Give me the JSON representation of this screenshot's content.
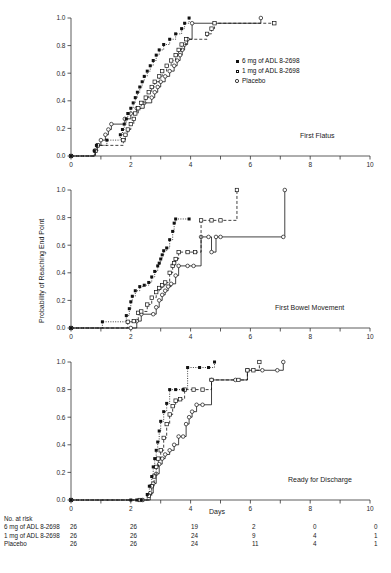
{
  "figure": {
    "y_axis_label": "Probability of Reaching End Point",
    "x_axis_label": "Days",
    "risk_title": "No. at risk"
  },
  "legend": {
    "items": [
      {
        "label": "6 mg of ADL 8-2698",
        "marker": "filled-square-icon"
      },
      {
        "label": "1 mg of ADL 8-2698",
        "marker": "open-square-icon"
      },
      {
        "label": "Placebo",
        "marker": "open-circle-icon"
      }
    ]
  },
  "risk_table": {
    "columns": [
      "0",
      "2",
      "4",
      "6",
      "8",
      "10"
    ],
    "rows": [
      {
        "name": "6 mg of ADL 8-2698",
        "values": [
          "26",
          "26",
          "19",
          "2",
          "0",
          "0"
        ]
      },
      {
        "name": "1 mg of ADL 8-2698",
        "values": [
          "26",
          "26",
          "24",
          "9",
          "4",
          "1"
        ]
      },
      {
        "name": "Placebo",
        "values": [
          "26",
          "26",
          "24",
          "11",
          "4",
          "1"
        ]
      }
    ]
  },
  "chart_data": [
    {
      "type": "line",
      "title": "First Flatus",
      "panel_index": 0,
      "xlabel": "",
      "ylabel": "",
      "xlim": [
        0,
        10
      ],
      "ylim": [
        0,
        1.0
      ],
      "xticks": [
        0,
        1,
        2,
        3,
        4,
        5,
        6,
        7,
        8,
        9,
        10
      ],
      "xticklabels": [
        "0",
        "",
        "2",
        "",
        "4",
        "",
        "6",
        "",
        "8",
        "",
        "10"
      ],
      "yticks": [
        0.0,
        0.2,
        0.4,
        0.6,
        0.8,
        1.0
      ],
      "yticklabels": [
        "0.0",
        "0.2",
        "0.4",
        "0.6",
        "0.8",
        "1.0"
      ],
      "grid": false,
      "legend_position": "right-middle",
      "series": [
        {
          "name": "6 mg of ADL 8-2698",
          "marker": "filled-square",
          "linestyle": "dotted",
          "points": [
            [
              0,
              0.0
            ],
            [
              0.78,
              0.038
            ],
            [
              0.85,
              0.077
            ],
            [
              1.2,
              0.115
            ],
            [
              1.65,
              0.154
            ],
            [
              1.72,
              0.192
            ],
            [
              1.78,
              0.231
            ],
            [
              1.85,
              0.269
            ],
            [
              1.9,
              0.308
            ],
            [
              2.0,
              0.346
            ],
            [
              2.08,
              0.385
            ],
            [
              2.15,
              0.423
            ],
            [
              2.22,
              0.462
            ],
            [
              2.3,
              0.5
            ],
            [
              2.38,
              0.538
            ],
            [
              2.45,
              0.577
            ],
            [
              2.55,
              0.615
            ],
            [
              2.65,
              0.654
            ],
            [
              2.75,
              0.692
            ],
            [
              2.85,
              0.731
            ],
            [
              2.95,
              0.769
            ],
            [
              3.1,
              0.808
            ],
            [
              3.3,
              0.846
            ],
            [
              3.5,
              0.885
            ],
            [
              3.7,
              0.923
            ],
            [
              3.8,
              0.962
            ],
            [
              3.95,
              1.0
            ]
          ]
        },
        {
          "name": "1 mg of ADL 8-2698",
          "marker": "open-square",
          "linestyle": "dashed",
          "points": [
            [
              0,
              0.0
            ],
            [
              0.82,
              0.038
            ],
            [
              0.9,
              0.077
            ],
            [
              1.75,
              0.115
            ],
            [
              1.82,
              0.154
            ],
            [
              1.9,
              0.192
            ],
            [
              2.0,
              0.231
            ],
            [
              2.1,
              0.269
            ],
            [
              2.15,
              0.308
            ],
            [
              2.25,
              0.346
            ],
            [
              2.35,
              0.385
            ],
            [
              2.5,
              0.423
            ],
            [
              2.6,
              0.462
            ],
            [
              2.7,
              0.5
            ],
            [
              2.8,
              0.538
            ],
            [
              2.95,
              0.577
            ],
            [
              3.05,
              0.615
            ],
            [
              3.2,
              0.654
            ],
            [
              3.35,
              0.692
            ],
            [
              3.5,
              0.731
            ],
            [
              3.6,
              0.769
            ],
            [
              3.7,
              0.808
            ],
            [
              3.85,
              0.846
            ],
            [
              4.55,
              0.885
            ],
            [
              4.7,
              0.923
            ],
            [
              4.8,
              0.962
            ],
            [
              6.8,
              0.962
            ]
          ]
        },
        {
          "name": "Placebo",
          "marker": "open-circle",
          "linestyle": "solid",
          "points": [
            [
              0,
              0.0
            ],
            [
              0.8,
              0.038
            ],
            [
              0.88,
              0.077
            ],
            [
              1.0,
              0.115
            ],
            [
              1.15,
              0.154
            ],
            [
              1.25,
              0.192
            ],
            [
              1.35,
              0.231
            ],
            [
              1.8,
              0.269
            ],
            [
              2.0,
              0.308
            ],
            [
              2.2,
              0.346
            ],
            [
              2.45,
              0.385
            ],
            [
              2.7,
              0.423
            ],
            [
              2.8,
              0.462
            ],
            [
              2.9,
              0.5
            ],
            [
              3.0,
              0.538
            ],
            [
              3.15,
              0.577
            ],
            [
              3.3,
              0.615
            ],
            [
              3.45,
              0.654
            ],
            [
              3.55,
              0.692
            ],
            [
              3.65,
              0.731
            ],
            [
              3.72,
              0.769
            ],
            [
              3.8,
              0.808
            ],
            [
              3.9,
              0.846
            ],
            [
              4.05,
              0.962
            ],
            [
              6.35,
              1.0
            ]
          ]
        }
      ]
    },
    {
      "type": "line",
      "title": "First Bowel Movement",
      "panel_index": 1,
      "xlabel": "",
      "ylabel": "Probability of Reaching End Point",
      "xlim": [
        0,
        10
      ],
      "ylim": [
        0,
        1.0
      ],
      "xticks": [
        0,
        1,
        2,
        3,
        4,
        5,
        6,
        7,
        8,
        9,
        10
      ],
      "xticklabels": [
        "0",
        "",
        "2",
        "",
        "4",
        "",
        "6",
        "",
        "8",
        "",
        "10"
      ],
      "yticks": [
        0.0,
        0.2,
        0.4,
        0.6,
        0.8,
        1.0
      ],
      "yticklabels": [
        "0.0",
        "0.2",
        "0.4",
        "0.6",
        "0.8",
        "1.0"
      ],
      "grid": false,
      "series": [
        {
          "name": "6 mg of ADL 8-2698",
          "marker": "filled-square",
          "linestyle": "dotted",
          "points": [
            [
              0,
              0.0
            ],
            [
              1.05,
              0.045
            ],
            [
              1.85,
              0.09
            ],
            [
              1.95,
              0.14
            ],
            [
              2.0,
              0.19
            ],
            [
              2.05,
              0.23
            ],
            [
              2.15,
              0.27
            ],
            [
              2.3,
              0.3
            ],
            [
              2.45,
              0.31
            ],
            [
              2.6,
              0.33
            ],
            [
              2.7,
              0.37
            ],
            [
              2.8,
              0.41
            ],
            [
              2.9,
              0.45
            ],
            [
              2.95,
              0.47
            ],
            [
              3.0,
              0.5
            ],
            [
              3.05,
              0.53
            ],
            [
              3.1,
              0.56
            ],
            [
              3.2,
              0.58
            ],
            [
              3.3,
              0.64
            ],
            [
              3.4,
              0.7
            ],
            [
              3.45,
              0.76
            ],
            [
              3.5,
              0.79
            ],
            [
              3.95,
              0.79
            ]
          ]
        },
        {
          "name": "1 mg of ADL 8-2698",
          "marker": "open-square",
          "linestyle": "dashed",
          "points": [
            [
              0,
              0.0
            ],
            [
              1.9,
              0.045
            ],
            [
              2.1,
              0.05
            ],
            [
              2.25,
              0.11
            ],
            [
              2.35,
              0.12
            ],
            [
              2.55,
              0.17
            ],
            [
              2.7,
              0.22
            ],
            [
              2.85,
              0.26
            ],
            [
              2.95,
              0.29
            ],
            [
              3.05,
              0.31
            ],
            [
              3.15,
              0.33
            ],
            [
              3.3,
              0.4
            ],
            [
              3.4,
              0.45
            ],
            [
              3.45,
              0.47
            ],
            [
              3.5,
              0.5
            ],
            [
              3.6,
              0.55
            ],
            [
              3.9,
              0.55
            ],
            [
              4.15,
              0.55
            ],
            [
              4.35,
              0.78
            ],
            [
              4.7,
              0.78
            ],
            [
              5.0,
              0.78
            ],
            [
              5.55,
              1.0
            ]
          ]
        },
        {
          "name": "Placebo",
          "marker": "open-circle",
          "linestyle": "solid",
          "points": [
            [
              0,
              0.0
            ],
            [
              2.0,
              0.0
            ],
            [
              2.2,
              0.05
            ],
            [
              2.35,
              0.1
            ],
            [
              2.75,
              0.1
            ],
            [
              2.85,
              0.15
            ],
            [
              2.95,
              0.2
            ],
            [
              3.05,
              0.24
            ],
            [
              3.15,
              0.27
            ],
            [
              3.25,
              0.3
            ],
            [
              3.35,
              0.32
            ],
            [
              3.5,
              0.38
            ],
            [
              3.6,
              0.45
            ],
            [
              3.9,
              0.45
            ],
            [
              4.1,
              0.45
            ],
            [
              4.35,
              0.66
            ],
            [
              4.6,
              0.66
            ],
            [
              4.7,
              0.55
            ],
            [
              4.85,
              0.66
            ],
            [
              5.0,
              0.66
            ],
            [
              7.1,
              0.66
            ],
            [
              7.15,
              1.0
            ]
          ]
        }
      ]
    },
    {
      "type": "line",
      "title": "Ready for Discharge",
      "panel_index": 2,
      "xlabel": "Days",
      "ylabel": "",
      "xlim": [
        0,
        10
      ],
      "ylim": [
        0,
        1.0
      ],
      "xticks": [
        0,
        1,
        2,
        3,
        4,
        5,
        6,
        7,
        8,
        9,
        10
      ],
      "xticklabels": [
        "0",
        "",
        "2",
        "",
        "4",
        "",
        "6",
        "",
        "8",
        "",
        "10"
      ],
      "yticks": [
        0.0,
        0.2,
        0.4,
        0.6,
        0.8,
        1.0
      ],
      "yticklabels": [
        "0.0",
        "0.2",
        "0.4",
        "0.6",
        "0.8",
        "1.0"
      ],
      "grid": false,
      "series": [
        {
          "name": "6 mg of ADL 8-2698",
          "marker": "filled-square",
          "linestyle": "dotted",
          "points": [
            [
              0,
              0.0
            ],
            [
              2.0,
              0.0
            ],
            [
              2.2,
              0.0
            ],
            [
              2.35,
              0.0
            ],
            [
              2.55,
              0.04
            ],
            [
              2.62,
              0.1
            ],
            [
              2.7,
              0.17
            ],
            [
              2.75,
              0.24
            ],
            [
              2.8,
              0.3
            ],
            [
              2.85,
              0.36
            ],
            [
              2.9,
              0.42
            ],
            [
              2.95,
              0.5
            ],
            [
              3.0,
              0.57
            ],
            [
              3.1,
              0.64
            ],
            [
              3.2,
              0.7
            ],
            [
              3.3,
              0.8
            ],
            [
              3.5,
              0.8
            ],
            [
              3.75,
              0.8
            ],
            [
              3.9,
              0.96
            ],
            [
              4.3,
              0.96
            ],
            [
              4.6,
              0.96
            ],
            [
              4.8,
              1.0
            ]
          ]
        },
        {
          "name": "1 mg of ADL 8-2698",
          "marker": "open-square",
          "linestyle": "dashed",
          "points": [
            [
              0,
              0.0
            ],
            [
              2.3,
              0.0
            ],
            [
              2.6,
              0.03
            ],
            [
              2.7,
              0.1
            ],
            [
              2.78,
              0.17
            ],
            [
              2.85,
              0.24
            ],
            [
              2.92,
              0.3
            ],
            [
              3.0,
              0.36
            ],
            [
              3.1,
              0.45
            ],
            [
              3.2,
              0.55
            ],
            [
              3.3,
              0.62
            ],
            [
              3.4,
              0.68
            ],
            [
              3.5,
              0.72
            ],
            [
              3.65,
              0.73
            ],
            [
              3.8,
              0.8
            ],
            [
              4.1,
              0.8
            ],
            [
              4.4,
              0.8
            ],
            [
              4.7,
              0.87
            ],
            [
              5.6,
              0.87
            ],
            [
              5.9,
              0.94
            ],
            [
              6.1,
              0.94
            ],
            [
              6.3,
              1.0
            ]
          ]
        },
        {
          "name": "Placebo",
          "marker": "open-circle",
          "linestyle": "solid",
          "points": [
            [
              0,
              0.0
            ],
            [
              2.4,
              0.0
            ],
            [
              2.65,
              0.05
            ],
            [
              2.75,
              0.12
            ],
            [
              2.85,
              0.19
            ],
            [
              2.95,
              0.26
            ],
            [
              3.05,
              0.3
            ],
            [
              3.15,
              0.33
            ],
            [
              3.3,
              0.36
            ],
            [
              3.45,
              0.4
            ],
            [
              3.6,
              0.46
            ],
            [
              3.75,
              0.46
            ],
            [
              3.85,
              0.55
            ],
            [
              3.95,
              0.6
            ],
            [
              4.05,
              0.64
            ],
            [
              4.2,
              0.69
            ],
            [
              4.4,
              0.69
            ],
            [
              4.7,
              0.87
            ],
            [
              5.5,
              0.87
            ],
            [
              5.9,
              0.94
            ],
            [
              6.4,
              0.94
            ],
            [
              6.9,
              0.94
            ],
            [
              7.1,
              1.0
            ]
          ]
        }
      ]
    }
  ]
}
